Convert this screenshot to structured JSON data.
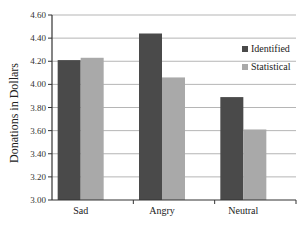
{
  "chart_data": {
    "type": "bar",
    "title": "",
    "xlabel": "",
    "ylabel": "Donations in Dollars",
    "ylim": [
      3.0,
      4.6
    ],
    "yticks": [
      "3.00",
      "3.20",
      "3.40",
      "3.60",
      "3.80",
      "4.00",
      "4.20",
      "4.40",
      "4.60"
    ],
    "categories": [
      "Sad",
      "Angry",
      "Neutral"
    ],
    "series": [
      {
        "name": "Identified",
        "color": "#4a4a4a",
        "values": [
          4.21,
          4.44,
          3.89
        ]
      },
      {
        "name": "Statistical",
        "color": "#a9a9a9",
        "values": [
          4.23,
          4.06,
          3.61
        ]
      }
    ],
    "grid": true,
    "legend_position": "right"
  }
}
